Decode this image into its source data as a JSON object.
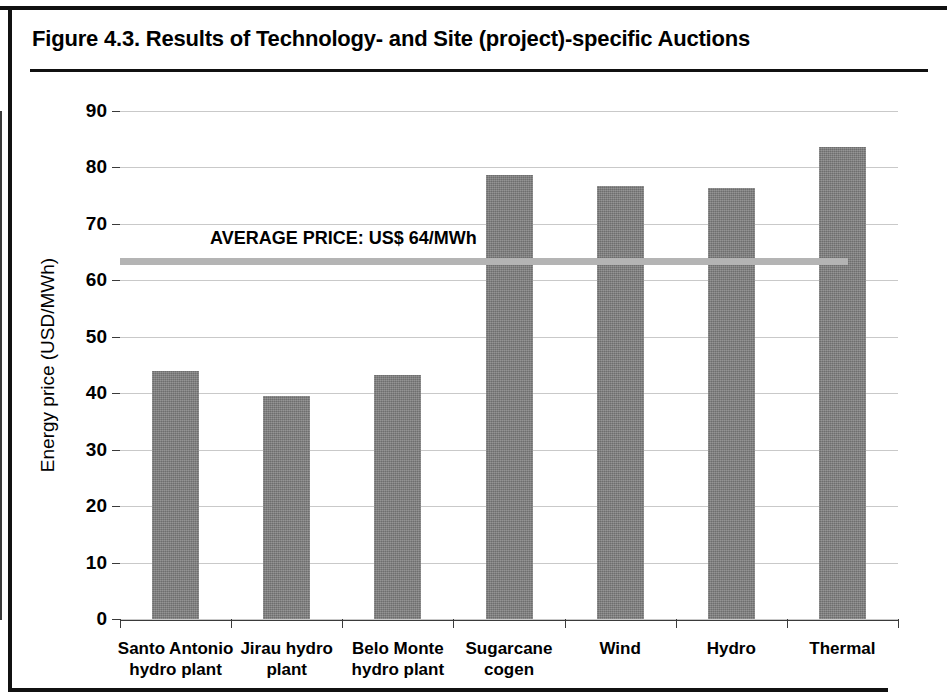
{
  "figure": {
    "title": "Figure 4.3.  Results of Technology- and Site (project)-specific Auctions"
  },
  "chart_data": {
    "type": "bar",
    "title": "Figure 4.3.  Results of Technology- and Site (project)-specific Auctions",
    "xlabel": "",
    "ylabel": "Energy price (USD/MWh)",
    "ylim": [
      0,
      90
    ],
    "ytick_step": 10,
    "yticks": [
      0,
      10,
      20,
      30,
      40,
      50,
      60,
      70,
      80,
      90
    ],
    "ytick_labels": [
      "0",
      "10",
      "20",
      "30",
      "40",
      "50",
      "60",
      "70",
      "80",
      "90"
    ],
    "grid": true,
    "legend": "none",
    "categories": [
      "Santo Antonio hydro plant",
      "Jirau hydro plant",
      "Belo Monte hydro plant",
      "Sugarcane cogen",
      "Wind",
      "Hydro",
      "Thermal"
    ],
    "category_lines": [
      [
        "Santo Antonio",
        "hydro plant"
      ],
      [
        "Jirau hydro",
        "plant"
      ],
      [
        "Belo Monte",
        "hydro plant"
      ],
      [
        "Sugarcane",
        "cogen"
      ],
      [
        "Wind",
        ""
      ],
      [
        "Hydro",
        ""
      ],
      [
        "Thermal",
        ""
      ]
    ],
    "values": [
      44.0,
      39.5,
      43.2,
      78.7,
      76.7,
      76.3,
      83.7
    ],
    "bar_color": "#7d7d7d",
    "annotations": [
      {
        "name": "average-price-line",
        "label": "AVERAGE PRICE: US$ 64/MWh",
        "value": 63.5,
        "color": "#b4b4b4",
        "style": "horizontal-line"
      }
    ]
  }
}
